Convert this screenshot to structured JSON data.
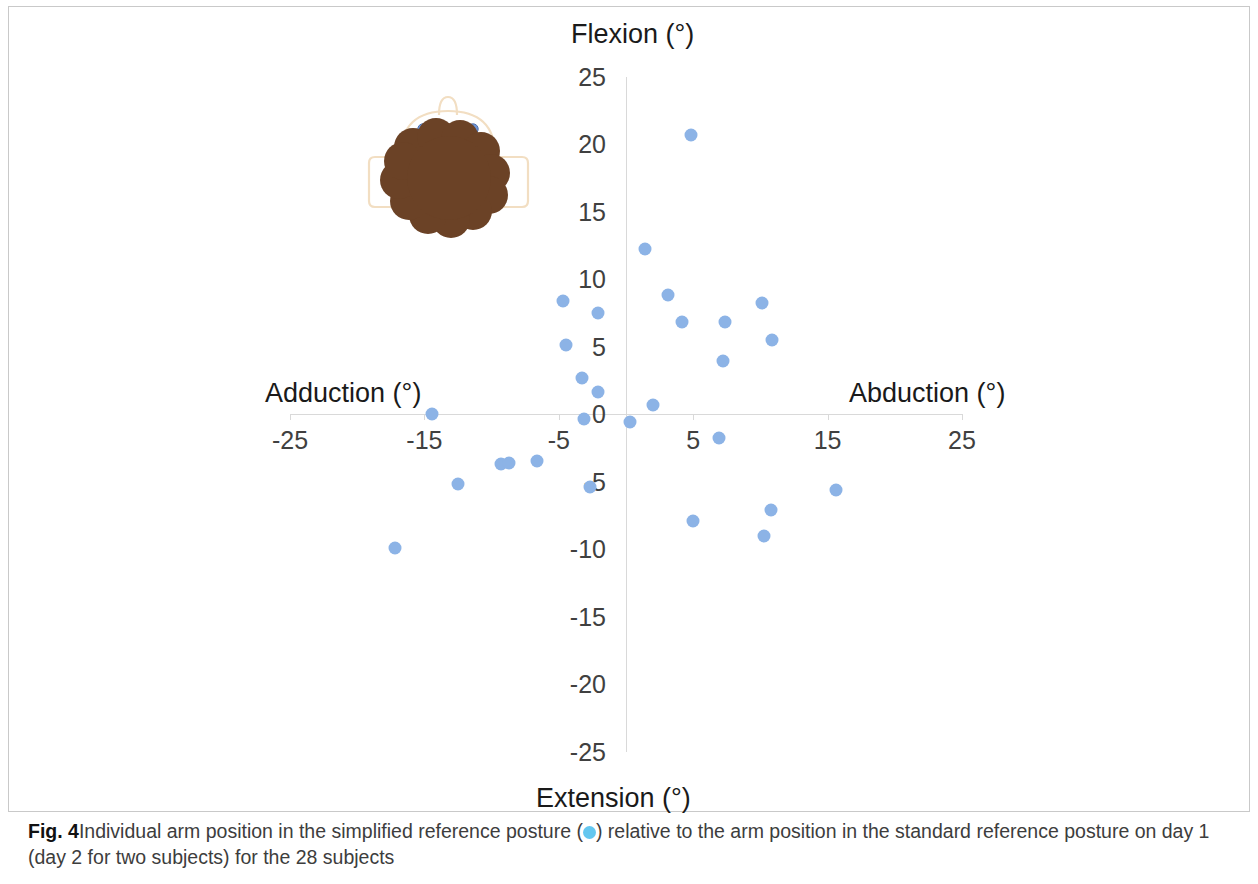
{
  "figure": {
    "caption_label": "Fig. 4",
    "caption_text_part1": "Individual arm position in the simplified reference posture (",
    "caption_text_part2": ") relative to the arm position in the standard reference posture on day 1 (day 2 for two subjects) for the 28 subjects",
    "legend_marker_name": "light-blue-filled-circle"
  },
  "colors": {
    "point_fill": "#8cb3e6",
    "legend_dot": "#63c7f0",
    "axis_line": "#d9d9d9",
    "tick_label": "#404040",
    "axis_title": "#1a1a1a",
    "body_outline": "#f5e3c8",
    "body_fill": "#6b4226",
    "eye_fill": "#6f95d6",
    "panel_border": "#c9c9c9"
  },
  "chart_data": {
    "type": "scatter",
    "title": "",
    "subtitle": "",
    "xlabel_negative": "Adduction (°)",
    "xlabel_positive": "Abduction (°)",
    "ylabel_positive": "Flexion (°)",
    "ylabel_negative": "Extension (°)",
    "xlim": [
      -25,
      25
    ],
    "ylim": [
      -25,
      25
    ],
    "xticks": [
      -25,
      -15,
      -5,
      5,
      15,
      25
    ],
    "xtick_labels": [
      "-25",
      "-15",
      "-5",
      "5",
      "15",
      "25"
    ],
    "yticks": [
      25,
      20,
      15,
      10,
      5,
      0,
      -5,
      -10,
      -15,
      -20,
      -25
    ],
    "ytick_labels": [
      "25",
      "20",
      "15",
      "10",
      "5",
      "0",
      "-5",
      "-10",
      "-15",
      "-20",
      "-25"
    ],
    "grid": false,
    "legend": "",
    "legend_position": "none",
    "marker_color": "#8cb3e6",
    "n_points": 28,
    "series": [
      {
        "name": "Individual arm position (simplified reference posture)",
        "points": [
          {
            "x": 4.8,
            "y": 20.7
          },
          {
            "x": 1.4,
            "y": 12.2
          },
          {
            "x": 3.1,
            "y": 8.8
          },
          {
            "x": -4.7,
            "y": 8.4
          },
          {
            "x": 10.1,
            "y": 8.2
          },
          {
            "x": -2.1,
            "y": 7.5
          },
          {
            "x": 4.2,
            "y": 6.8
          },
          {
            "x": 7.4,
            "y": 6.8
          },
          {
            "x": 10.9,
            "y": 5.5
          },
          {
            "x": -4.5,
            "y": 5.1
          },
          {
            "x": 7.2,
            "y": 3.9
          },
          {
            "x": -3.3,
            "y": 2.7
          },
          {
            "x": -2.1,
            "y": 1.6
          },
          {
            "x": 2.0,
            "y": 0.7
          },
          {
            "x": -14.4,
            "y": 0.0
          },
          {
            "x": -3.1,
            "y": -0.4
          },
          {
            "x": 0.3,
            "y": -0.6
          },
          {
            "x": 6.9,
            "y": -1.8
          },
          {
            "x": -9.3,
            "y": -3.7
          },
          {
            "x": -8.7,
            "y": -3.6
          },
          {
            "x": -2.7,
            "y": -5.4
          },
          {
            "x": -12.5,
            "y": -5.2
          },
          {
            "x": 15.6,
            "y": -5.6
          },
          {
            "x": 10.8,
            "y": -7.1
          },
          {
            "x": 5.0,
            "y": -7.9
          },
          {
            "x": 10.3,
            "y": -9.0
          },
          {
            "x": -17.2,
            "y": -9.9
          },
          {
            "x": -6.6,
            "y": -3.5
          }
        ]
      }
    ]
  },
  "schematic": {
    "name": "upper-body-shoulder-schematic",
    "description": "brown scalloped torso shape with outlined head and arms"
  }
}
